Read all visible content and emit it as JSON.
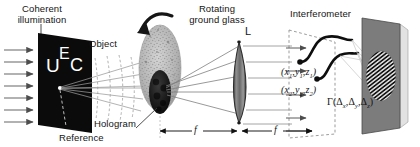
{
  "figure": {
    "background": "#ffffff",
    "width": 420,
    "height": 147
  },
  "labels": {
    "coherent_line1": "Coherent",
    "coherent_line2": "illumination",
    "object": "Object",
    "reference": "Reference",
    "hologram": "Hologram",
    "rotating_line1": "Rotating",
    "rotating_line2": "ground glass",
    "lens": "L",
    "interferometer": "Interferometer",
    "focal_left": "f",
    "focal_right": "f",
    "object_letter_u": "U",
    "object_letter_e": "E",
    "object_letter_c": "C"
  },
  "coordinates": {
    "point1": "(x1,y1,z1)",
    "point2": "(x2,y2,z2)",
    "point1_parts": {
      "open": "(",
      "x": "x",
      "x_sub": "1",
      "y": "y",
      "y_sub": "1",
      "z": "z",
      "z_sub": "1",
      "close": ")"
    },
    "point2_parts": {
      "open": "(",
      "x": "x",
      "x_sub": "2",
      "y": "y",
      "y_sub": "2",
      "z": "z",
      "z_sub": "2",
      "close": ")"
    }
  },
  "correlation": {
    "symbol": "Γ",
    "open": "(",
    "delta": "Δ",
    "sub_x": "x",
    "sub_y": "y",
    "sub_z": "z",
    "comma": ",",
    "close": ")",
    "full": "Γ(Δx,Δy,Δz)"
  },
  "elements": {
    "illumination_arrows": 7,
    "object_mask_fill": "#0a0a0a",
    "ground_glass_fill": "#b8b8b8",
    "hologram_fill": "#1a1a1a",
    "lens_fill": "#555555",
    "detector_fill": "#7a7a7a",
    "fringe_color": "#1c1c1c",
    "ray_color": "#6e6e6e",
    "fiber_color": "#111111",
    "dashed_color": "#8a8a8a"
  }
}
